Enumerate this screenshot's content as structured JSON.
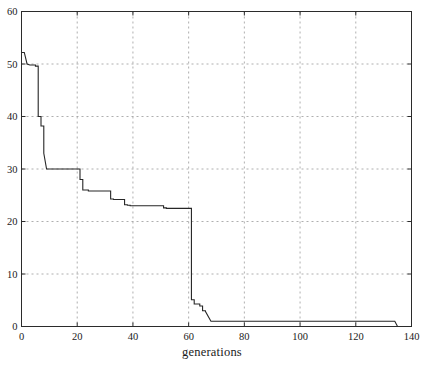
{
  "chart_data": {
    "type": "line",
    "title": "",
    "subtitle": "",
    "xlabel": "generations",
    "ylabel": "",
    "xlim": [
      0,
      140
    ],
    "ylim": [
      0,
      60
    ],
    "xticks": [
      0,
      20,
      40,
      60,
      80,
      100,
      120,
      140
    ],
    "yticks": [
      0,
      10,
      20,
      30,
      40,
      50,
      60
    ],
    "xtick_labels": [
      "0",
      "20",
      "40",
      "60",
      "80",
      "100",
      "120",
      "140"
    ],
    "ytick_labels": [
      "0",
      "10",
      "20",
      "30",
      "40",
      "50",
      "60"
    ],
    "grid": true,
    "grid_style": "dashed",
    "grid_color": "#9a9a9a",
    "line_color": "#262626",
    "line_width": 1.1,
    "legend": null,
    "legend_position": "none",
    "annotations": [],
    "series": [
      {
        "name": "best fitness",
        "x": [
          0,
          1,
          2,
          2,
          3,
          5,
          5,
          6,
          6,
          7,
          7,
          8,
          8,
          9,
          9,
          21,
          21,
          22,
          22,
          24,
          24,
          32,
          32,
          33,
          33,
          37,
          37,
          38,
          38,
          39,
          39,
          51,
          51,
          52,
          52,
          60,
          60,
          61,
          61,
          62,
          62,
          64,
          64,
          65,
          65,
          66,
          66,
          68,
          68,
          134,
          134,
          135
        ],
        "y": [
          52.2,
          52.2,
          50.0,
          50.0,
          49.8,
          49.8,
          49.6,
          49.6,
          40.0,
          40.0,
          38.2,
          38.2,
          33.0,
          30.0,
          30.0,
          30.0,
          28.0,
          28.0,
          26.0,
          26.0,
          25.8,
          25.8,
          24.3,
          24.3,
          24.2,
          24.2,
          23.2,
          23.2,
          23.1,
          23.1,
          23.0,
          23.0,
          22.6,
          22.6,
          22.5,
          22.5,
          22.5,
          22.5,
          5.1,
          5.1,
          4.3,
          4.3,
          3.9,
          3.9,
          3.0,
          3.0,
          2.9,
          1.0,
          1.0,
          1.0,
          1.0,
          0.0
        ]
      }
    ]
  },
  "axes": {
    "x_label_text": "generations",
    "y_top_label": "60",
    "y_bottom_label": "0",
    "x_left_label": "0",
    "x_right_label": "140"
  }
}
